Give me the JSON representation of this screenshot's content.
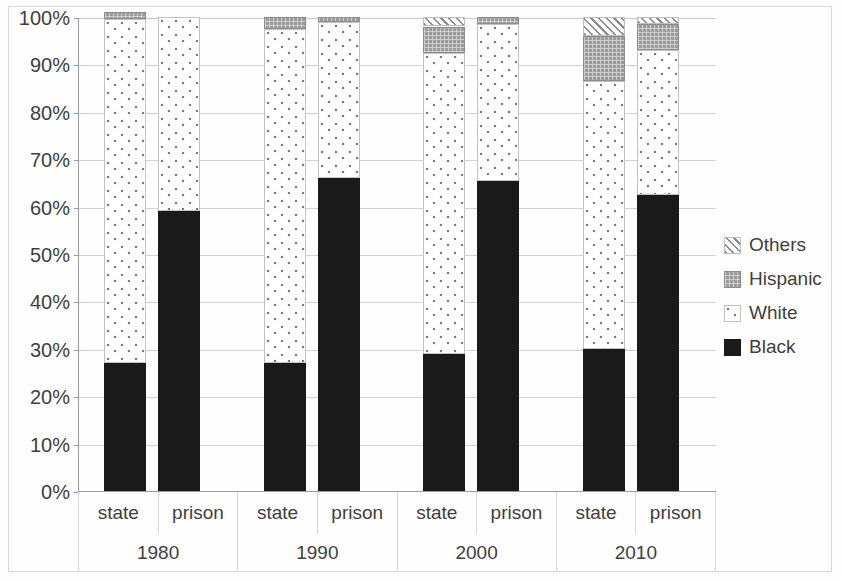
{
  "chart_data": {
    "type": "bar",
    "subtype": "stacked-100-percent",
    "title": "",
    "subtitle": "",
    "xlabel": "",
    "ylabel": "",
    "ylim": [
      0,
      100
    ],
    "ytick_labels": [
      "100%",
      "90%",
      "80%",
      "70%",
      "60%",
      "50%",
      "40%",
      "30%",
      "20%",
      "10%",
      "0%"
    ],
    "ytick_values": [
      100,
      90,
      80,
      70,
      60,
      50,
      40,
      30,
      20,
      10,
      0
    ],
    "grid": true,
    "legend_position": "right",
    "groups": [
      "1980",
      "1990",
      "2000",
      "2010"
    ],
    "subcategories": [
      "state",
      "prison"
    ],
    "categories": [
      "1980 state",
      "1980 prison",
      "1990 state",
      "1990 prison",
      "2000 state",
      "2000 prison",
      "2010 state",
      "2010 prison"
    ],
    "series": [
      {
        "name": "Black",
        "values": [
          27.0,
          59.0,
          27.0,
          66.0,
          29.0,
          65.5,
          30.0,
          62.5
        ]
      },
      {
        "name": "White",
        "values": [
          72.5,
          41.0,
          70.5,
          33.0,
          63.5,
          33.0,
          56.5,
          30.5
        ]
      },
      {
        "name": "Hispanic",
        "values": [
          1.5,
          0.0,
          2.5,
          1.0,
          5.5,
          1.5,
          9.5,
          5.5
        ]
      },
      {
        "name": "Others",
        "values": [
          0.0,
          0.0,
          0.0,
          0.0,
          2.0,
          0.0,
          4.0,
          1.5
        ]
      }
    ],
    "legend": [
      "Others",
      "Hispanic",
      "White",
      "Black"
    ],
    "colors": {
      "black": "#1a1a1a",
      "white": "#ffffff",
      "hispanic": "#9c9c9c",
      "others": "#8a8a8a",
      "gridline": "#d2d2d2",
      "axis": "#9a9a9a",
      "text": "#3f3f3f"
    }
  },
  "axis": {
    "y_ticks": [
      {
        "label": "100%",
        "value": 100
      },
      {
        "label": "90%",
        "value": 90
      },
      {
        "label": "80%",
        "value": 80
      },
      {
        "label": "70%",
        "value": 70
      },
      {
        "label": "60%",
        "value": 60
      },
      {
        "label": "50%",
        "value": 50
      },
      {
        "label": "40%",
        "value": 40
      },
      {
        "label": "30%",
        "value": 30
      },
      {
        "label": "20%",
        "value": 20
      },
      {
        "label": "10%",
        "value": 10
      },
      {
        "label": "0%",
        "value": 0
      }
    ],
    "x_groups": [
      {
        "year": "1980",
        "subs": [
          "state",
          "prison"
        ]
      },
      {
        "year": "1990",
        "subs": [
          "state",
          "prison"
        ]
      },
      {
        "year": "2000",
        "subs": [
          "state",
          "prison"
        ]
      },
      {
        "year": "2010",
        "subs": [
          "state",
          "prison"
        ]
      }
    ]
  },
  "legend": {
    "items": [
      {
        "label": "Others",
        "swatch": "hatch-diagonal-swatch"
      },
      {
        "label": "Hispanic",
        "swatch": "gray-checker-swatch"
      },
      {
        "label": "White",
        "swatch": "light-dotted-swatch"
      },
      {
        "label": "Black",
        "swatch": "solid-black-swatch"
      }
    ]
  }
}
